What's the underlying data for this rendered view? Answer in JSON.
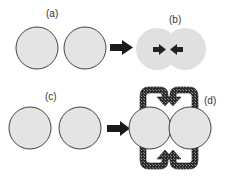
{
  "panels": {
    "a": {
      "label": "(a)"
    },
    "b": {
      "label": "(b)"
    },
    "c": {
      "label": "(c)"
    },
    "d": {
      "label": "(d)"
    }
  },
  "colors": {
    "circle_fill": "#e4e4e4",
    "circle_stroke": "#444444",
    "merged_fill": "#e0e0e0",
    "arrow": "#1a1a1a",
    "loop_arrow": "#3a3a3a"
  }
}
